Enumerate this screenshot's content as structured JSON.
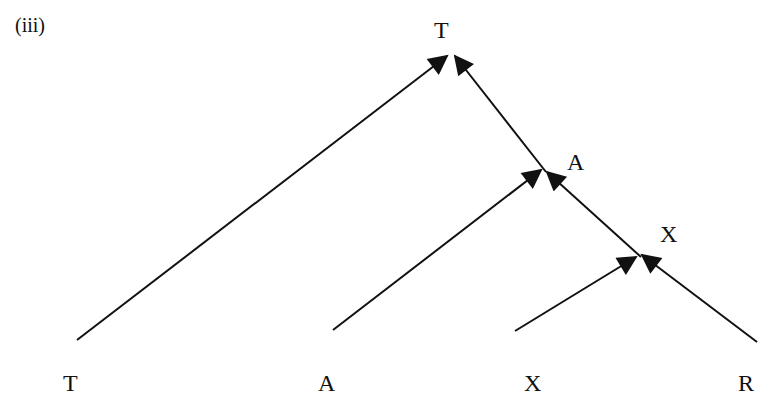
{
  "figure": {
    "part_label": "(iii)",
    "root_label": "T",
    "internal_nodes": [
      {
        "label": "A"
      },
      {
        "label": "X"
      }
    ],
    "leaves": [
      {
        "label": "T"
      },
      {
        "label": "A"
      },
      {
        "label": "X"
      },
      {
        "label": "R"
      }
    ],
    "edge_color": "#111111",
    "edges": [
      {
        "from": "T (leaf)",
        "to": "T (root)"
      },
      {
        "from": "A (node)",
        "to": "T (root)"
      },
      {
        "from": "A (leaf)",
        "to": "A (node)"
      },
      {
        "from": "X (node)",
        "to": "A (node)"
      },
      {
        "from": "X (leaf)",
        "to": "X (node)"
      },
      {
        "from": "R (leaf)",
        "to": "X (node)"
      }
    ]
  }
}
